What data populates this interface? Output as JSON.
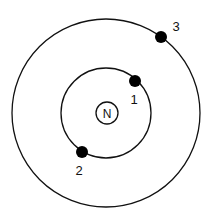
{
  "diagram": {
    "title": "",
    "nucleus": {
      "label": "N",
      "cx": 107,
      "cy": 113,
      "r": 11
    },
    "orbits": [
      {
        "name": "inner-orbit",
        "cx": 106,
        "cy": 113,
        "r": 45
      },
      {
        "name": "outer-orbit",
        "cx": 106,
        "cy": 113,
        "r": 94
      }
    ],
    "electrons": [
      {
        "id": "1",
        "label": "1",
        "cx": 135,
        "cy": 81,
        "r": 6,
        "label_x": 134,
        "label_y": 104
      },
      {
        "id": "2",
        "label": "2",
        "cx": 82,
        "cy": 152,
        "r": 6,
        "label_x": 79,
        "label_y": 175
      },
      {
        "id": "3",
        "label": "3",
        "cx": 161,
        "cy": 37,
        "r": 6,
        "label_x": 176,
        "label_y": 31
      }
    ],
    "colors": {
      "stroke": "#111111",
      "fill": "#000000",
      "background": "#ffffff"
    }
  }
}
